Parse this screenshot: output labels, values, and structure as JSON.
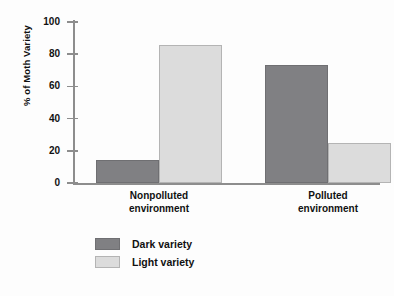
{
  "chart_data": {
    "type": "bar",
    "title": "",
    "xlabel": "",
    "ylabel": "% of Moth Variety",
    "ylim": [
      0,
      100
    ],
    "ytick_labels": [
      "100",
      "80",
      "60",
      "40",
      "20",
      "0"
    ],
    "yticks": [
      100,
      80,
      60,
      40,
      20,
      0
    ],
    "grid": false,
    "legend_position": "bottom-left",
    "categories": [
      "Nonpolluted environment",
      "Polluted environment"
    ],
    "category_lines": [
      [
        "Nonpolluted",
        "environment"
      ],
      [
        "Polluted",
        "environment"
      ]
    ],
    "series": [
      {
        "name": "Dark variety",
        "color": "#808083",
        "values": [
          14,
          73
        ]
      },
      {
        "name": "Light variety",
        "color": "#dcdcdc",
        "values": [
          86,
          25
        ]
      }
    ]
  },
  "legend": {
    "items": [
      {
        "label": "Dark variety",
        "swatch": "dark"
      },
      {
        "label": "Light variety",
        "swatch": "light"
      }
    ]
  },
  "colors": {
    "dark_variety": "#808083",
    "light_variety": "#dcdcdc",
    "axis": "#8d8d8d",
    "text": "#111111",
    "background": "#fdfdfd"
  }
}
